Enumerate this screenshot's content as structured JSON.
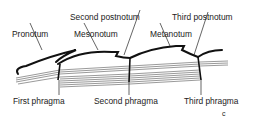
{
  "diagram": {
    "top_labels": {
      "pronotum": "Pronotum",
      "second_postnotum": "Second postnotum",
      "mesonotum": "Mesonotum",
      "metanotum": "Metanotum",
      "third_postnotum": "Third postnotum"
    },
    "bottom_labels": {
      "first_phragma": "First phragma",
      "second_phragma": "Second  phragma",
      "third_phragma": "Third phragma"
    },
    "panel_letter": "c"
  }
}
